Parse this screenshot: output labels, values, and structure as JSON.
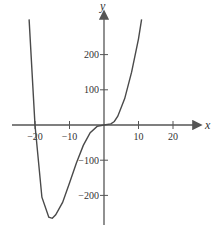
{
  "chart_data": {
    "type": "line",
    "title": "",
    "xlabel": "x",
    "ylabel": "y",
    "xlim": [
      -30,
      30
    ],
    "ylim": [
      -280,
      330
    ],
    "x_ticks": [
      -20,
      -10,
      10,
      20
    ],
    "y_ticks": [
      -200,
      -100,
      100,
      200
    ],
    "x_tick_labels": [
      "−20",
      "−10",
      "10",
      "20"
    ],
    "y_tick_labels": [
      "−200",
      "−100",
      "100",
      "200"
    ],
    "grid": false,
    "legend": null,
    "series": [
      {
        "name": "f(x)",
        "x": [
          -21.7,
          -20,
          -18,
          -16,
          -15,
          -14,
          -12,
          -10,
          -8,
          -6,
          -4,
          -2,
          0,
          2,
          3,
          4,
          6,
          8,
          10,
          10.9
        ],
        "y": [
          300,
          0,
          -205,
          -262,
          -265,
          -255,
          -220,
          -165,
          -108,
          -58,
          -22,
          -4,
          0,
          3,
          10,
          25,
          75,
          150,
          245,
          300
        ]
      }
    ],
    "color": "#4a4a4a"
  }
}
